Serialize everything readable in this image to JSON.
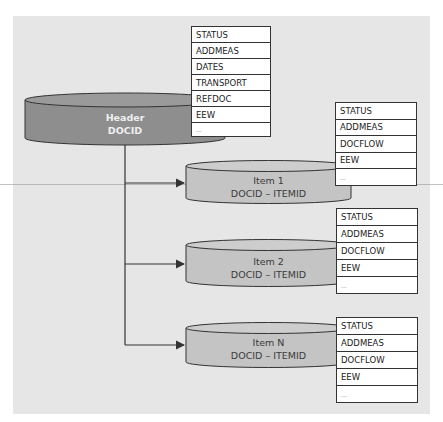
{
  "colors": {
    "panel_bg": "#e6e6e6",
    "header_cylinder": "#8e8e8e",
    "item_cylinder": "#c4c4c4",
    "line": "#333333"
  },
  "header": {
    "title": "Header",
    "key": "DOCID",
    "fields": [
      "STATUS",
      "ADDMEAS",
      "DATES",
      "TRANSPORT",
      "REFDOC",
      "EEW",
      "..."
    ]
  },
  "items": [
    {
      "title": "Item 1",
      "key": "DOCID – ITEMID",
      "fields": [
        "STATUS",
        "ADDMEAS",
        "DOCFLOW",
        "EEW",
        "..."
      ]
    },
    {
      "title": "Item 2",
      "key": "DOCID – ITEMID",
      "fields": [
        "STATUS",
        "ADDMEAS",
        "DOCFLOW",
        "EEW",
        "..."
      ]
    },
    {
      "title": "Item N",
      "key": "DOCID – ITEMID",
      "fields": [
        "STATUS",
        "ADDMEAS",
        "DOCFLOW",
        "EEW",
        "..."
      ]
    }
  ]
}
